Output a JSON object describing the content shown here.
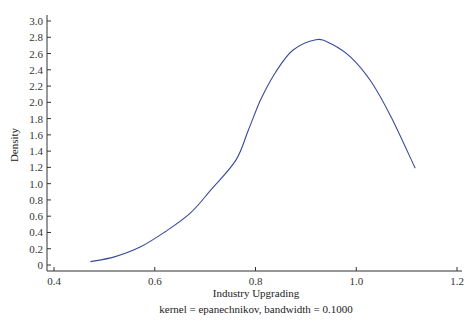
{
  "chart_data": {
    "type": "line",
    "title": "",
    "xlabel": "Industry Upgrading",
    "ylabel": "Density",
    "note": "kernel = epanechnikov, bandwidth = 0.1000",
    "xlim": [
      0.4,
      1.2
    ],
    "ylim": [
      0,
      3.0
    ],
    "xticks": [
      0.4,
      0.6,
      0.8,
      1.0,
      1.2
    ],
    "xtick_labels": [
      "0.4",
      "0.6",
      "0.8",
      "1.0",
      "1.2"
    ],
    "yticks": [
      0,
      0.2,
      0.4,
      0.6,
      0.8,
      1.0,
      1.2,
      1.4,
      1.6,
      1.8,
      2.0,
      2.2,
      2.4,
      2.6,
      2.8,
      3.0
    ],
    "ytick_labels": [
      "0",
      "0.2",
      "0.4",
      "0.6",
      "0.8",
      "1.0",
      "1.2",
      "1.4",
      "1.6",
      "1.8",
      "2.0",
      "2.2",
      "2.4",
      "2.6",
      "2.8",
      "3.0"
    ],
    "grid": false,
    "legend": null,
    "series": [
      {
        "name": "Kernel density",
        "color": "#3a4a9a",
        "x": [
          0.472,
          0.52,
          0.571,
          0.621,
          0.671,
          0.711,
          0.761,
          0.786,
          0.81,
          0.84,
          0.874,
          0.92,
          0.95,
          0.99,
          1.03,
          1.07,
          1.117
        ],
        "y": [
          0.04,
          0.1,
          0.22,
          0.41,
          0.64,
          0.92,
          1.29,
          1.66,
          2.03,
          2.37,
          2.64,
          2.77,
          2.72,
          2.55,
          2.25,
          1.81,
          1.19
        ]
      }
    ]
  }
}
